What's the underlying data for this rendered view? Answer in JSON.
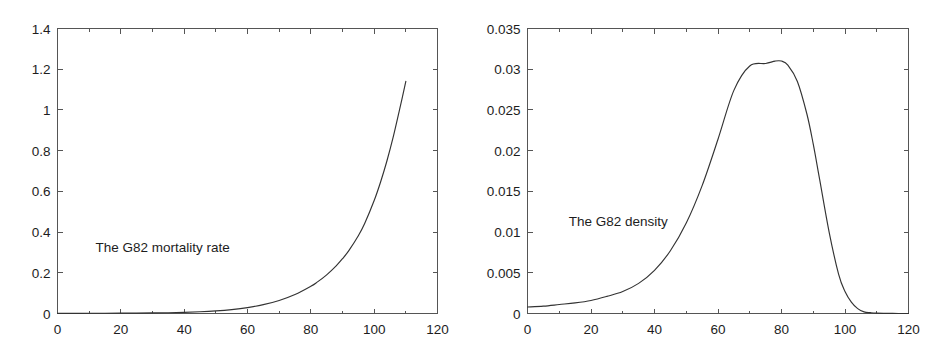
{
  "figure": {
    "background": "#ffffff",
    "axis_color": "#555555",
    "curve_color": "#333333",
    "text_color": "#1d1d1d"
  },
  "chart_data": [
    {
      "type": "line",
      "panel": "left",
      "title": "",
      "annotation": "The G82 mortality rate",
      "annotation_x": 12,
      "annotation_y": 0.3,
      "xlabel": "",
      "ylabel": "",
      "xlim": [
        0,
        120
      ],
      "ylim": [
        0,
        1.4
      ],
      "xticks": [
        0,
        20,
        40,
        60,
        80,
        100,
        120
      ],
      "xticklabels": [
        "0",
        "20",
        "40",
        "60",
        "80",
        "100",
        "120"
      ],
      "yticks": [
        0,
        0.2,
        0.4,
        0.6,
        0.8,
        1,
        1.2,
        1.4
      ],
      "yticklabels": [
        "0",
        "0.2",
        "0.4",
        "0.6",
        "0.8",
        "1",
        "1.2",
        "1.4"
      ],
      "grid": false,
      "legend": null,
      "x": [
        0,
        5,
        10,
        15,
        20,
        25,
        30,
        35,
        40,
        45,
        50,
        55,
        60,
        65,
        70,
        75,
        80,
        82,
        85,
        88,
        90,
        92,
        95,
        97,
        100,
        102,
        104,
        106,
        108,
        110
      ],
      "values": [
        0.0008,
        0.0009,
        0.0011,
        0.0013,
        0.0016,
        0.0021,
        0.0028,
        0.0039,
        0.0057,
        0.0085,
        0.0128,
        0.0193,
        0.029,
        0.0434,
        0.0642,
        0.0935,
        0.134,
        0.154,
        0.19,
        0.234,
        0.269,
        0.309,
        0.382,
        0.442,
        0.555,
        0.645,
        0.748,
        0.866,
        1.0,
        1.14
      ]
    },
    {
      "type": "line",
      "panel": "right",
      "title": "",
      "annotation": "The G82 density",
      "annotation_x": 13,
      "annotation_y": 0.0108,
      "xlabel": "",
      "ylabel": "",
      "xlim": [
        0,
        120
      ],
      "ylim": [
        0,
        0.035
      ],
      "xticks": [
        0,
        20,
        40,
        60,
        80,
        100,
        120
      ],
      "xticklabels": [
        "0",
        "20",
        "40",
        "60",
        "80",
        "100",
        "120"
      ],
      "yticks": [
        0,
        0.005,
        0.01,
        0.015,
        0.02,
        0.025,
        0.03,
        0.035
      ],
      "yticklabels": [
        "0",
        "0.005",
        "0.01",
        "0.015",
        "0.02",
        "0.025",
        "0.03",
        "0.035"
      ],
      "grid": false,
      "legend": null,
      "peak_x": 80,
      "peak_y": 0.031,
      "x": [
        0,
        5,
        10,
        15,
        20,
        25,
        30,
        35,
        40,
        45,
        50,
        55,
        60,
        65,
        70,
        75,
        78,
        80,
        82,
        85,
        88,
        90,
        92,
        95,
        98,
        100,
        102,
        104,
        106,
        108,
        110,
        115,
        120
      ],
      "values": [
        0.0008,
        0.0009,
        0.0011,
        0.0013,
        0.0016,
        0.0021,
        0.0027,
        0.0037,
        0.0053,
        0.0077,
        0.0111,
        0.0157,
        0.0214,
        0.0274,
        0.0304,
        0.0307,
        0.031,
        0.031,
        0.0305,
        0.0285,
        0.0245,
        0.0208,
        0.0165,
        0.01,
        0.0048,
        0.0027,
        0.0014,
        0.0006,
        0.0002,
        0.0001,
        5e-05,
        1e-05,
        1e-06
      ]
    }
  ]
}
